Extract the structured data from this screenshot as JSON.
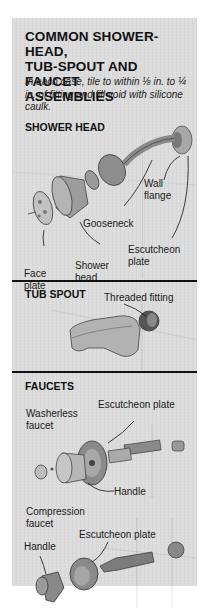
{
  "title": "COMMON SHOWER-HEAD, TUB-SPOUT AND FAUCET ASSEMBLIES",
  "title_lines": [
    "COMMON SHOWER-HEAD,",
    "TUB-SPOUT AND FAUCET",
    "ASSEMBLIES"
  ],
  "subtitle": "In each case, tile to within ⅛ in. to ¼ in. of fitting and fill void with silicone caulk.",
  "sections": {
    "shower_head": {
      "heading": "SHOWER HEAD",
      "labels": {
        "wall_flange": [
          "Wall",
          "flange"
        ],
        "gooseneck": "Gooseneck",
        "escutcheon": [
          "Escutcheon",
          "plate"
        ],
        "face_plate": [
          "Face",
          "plate"
        ],
        "shower_head": [
          "Shower",
          "head"
        ]
      }
    },
    "tub_spout": {
      "heading": "TUB SPOUT",
      "labels": {
        "threaded_fitting": "Threaded fitting"
      }
    },
    "faucets": {
      "heading": "FAUCETS",
      "labels": {
        "escutcheon_top": "Escutcheon plate",
        "washerless": [
          "Washerless",
          "faucet"
        ],
        "handle_top": "Handle",
        "compression": [
          "Compression",
          "faucet"
        ],
        "escutcheon_bottom": "Escutcheon plate",
        "handle_bottom": "Handle"
      }
    }
  },
  "colors": {
    "panel_bg": "#dcdcdc",
    "ink": "#111111",
    "fixture_dark": "#6e6e6e",
    "fixture_mid": "#9a9a9a",
    "fixture_light": "#bdbdbd"
  }
}
